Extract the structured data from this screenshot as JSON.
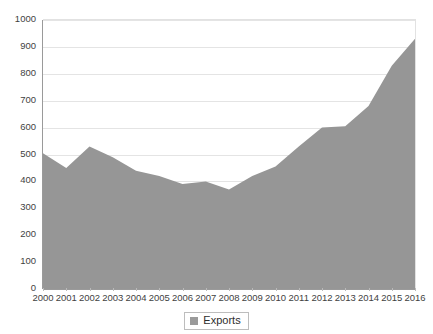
{
  "chart_data": {
    "type": "area",
    "title": "",
    "subtitle": "",
    "xlabel": "",
    "ylabel": "",
    "categories": [
      "2000",
      "2001",
      "2002",
      "2003",
      "2004",
      "2005",
      "2006",
      "2007",
      "2008",
      "2009",
      "2010",
      "2011",
      "2012",
      "2013",
      "2014",
      "2015",
      "2016"
    ],
    "series": [
      {
        "name": "Exports",
        "color": "#969696",
        "values": [
          505,
          450,
          530,
          490,
          440,
          420,
          390,
          400,
          370,
          420,
          455,
          530,
          600,
          605,
          680,
          830,
          930
        ]
      }
    ],
    "ylim": [
      0,
      1000
    ],
    "y_ticks": [
      0,
      100,
      200,
      300,
      400,
      500,
      600,
      700,
      800,
      900,
      1000
    ],
    "y_tick_labels": [
      "0",
      "100",
      "200",
      "300",
      "400",
      "500",
      "600",
      "700",
      "800",
      "900",
      "1000"
    ],
    "grid": true,
    "grid_axis": "y",
    "legend": {
      "position": "bottom",
      "entries": [
        {
          "label": "Exports",
          "swatch": "legend-swatch-icon",
          "color": "#9a9a9a"
        }
      ]
    },
    "colors": {
      "area_fill": "#969696",
      "gridline": "#e4e4e4",
      "axis": "#9a9a9a",
      "tick_label": "#3f3f3f",
      "background": "#ffffff"
    }
  }
}
